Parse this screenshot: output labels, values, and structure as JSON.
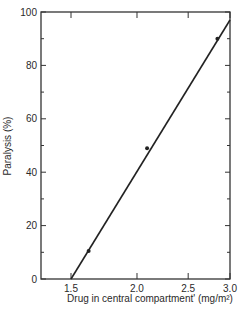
{
  "chart_data": {
    "type": "line",
    "title": "",
    "xlabel": "Drug in central compartment' (mg/m²)",
    "ylabel": "Paralysis (%)",
    "xscale": "log",
    "xlim": [
      1.5,
      3.0
    ],
    "ylim": [
      0,
      100
    ],
    "x_ticks": [
      1.5,
      2.0,
      2.5,
      3.0
    ],
    "x_tick_labels": [
      "1.5",
      "2.0",
      "2.5",
      "3.0"
    ],
    "y_ticks": [
      0,
      20,
      40,
      60,
      80,
      100
    ],
    "y_tick_labels": [
      "0",
      "20",
      "40",
      "60",
      "80",
      "100"
    ],
    "y_minor_ticks": [
      10,
      30,
      50,
      70,
      90
    ],
    "grid": false,
    "legend": null,
    "series": [
      {
        "name": "observed",
        "kind": "scatter",
        "x": [
          1.62,
          2.09,
          2.84
        ],
        "y": [
          10.5,
          49,
          90
        ]
      },
      {
        "name": "fitted line",
        "kind": "line",
        "x": [
          1.5,
          3.0
        ],
        "y": [
          0,
          97
        ]
      }
    ]
  }
}
